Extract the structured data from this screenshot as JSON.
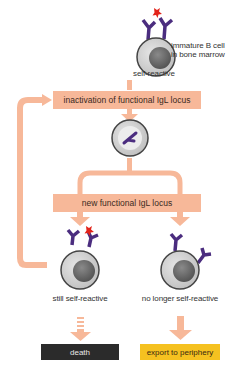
{
  "colors": {
    "flow": "#f7b899",
    "cell_outer": "#cfcfcf",
    "cell_ring": "#555555",
    "nucleus": "#6e6e6e",
    "receptor": "#4b2d7f",
    "antigen_mark": "#e2231a",
    "death_box": "#2b2b2b",
    "export_box": "#f5c120"
  },
  "top_cell": {
    "label_right_line1": "immature B cell",
    "label_right_line2": "in bone marrow",
    "label_below": "self-reactive"
  },
  "steps": {
    "inactivation": "inactivation of functional IgL locus",
    "new_locus": "new functional IgL locus"
  },
  "outcomes": {
    "left_label": "still self-reactive",
    "right_label": "no longer self-reactive",
    "left_fate": "death",
    "right_fate": "export to periphery"
  }
}
